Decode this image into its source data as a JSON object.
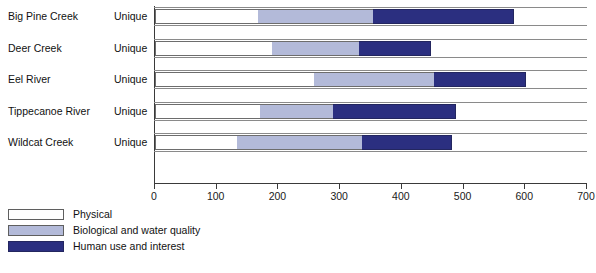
{
  "chart_data": {
    "type": "bar",
    "orientation": "horizontal",
    "stacked": true,
    "title": "",
    "xlabel": "",
    "ylabel": "",
    "xlim": [
      0,
      700
    ],
    "xticks": [
      0,
      100,
      200,
      300,
      400,
      500,
      600,
      700
    ],
    "grid": false,
    "legend_position": "bottom-left",
    "categories": [
      "Big Pine Creek",
      "Deer Creek",
      "Eel River",
      "Tippecanoe River",
      "Wildcat Creek"
    ],
    "row_annotations": [
      "Unique",
      "Unique",
      "Unique",
      "Unique",
      "Unique"
    ],
    "series": [
      {
        "name": "Physical",
        "color": "#ffffff",
        "values": [
          167,
          190,
          258,
          170,
          133
        ]
      },
      {
        "name": "Biological and water quality",
        "color": "#b3bad9",
        "values": [
          186,
          141,
          194,
          119,
          202
        ]
      },
      {
        "name": "Human use and interest",
        "color": "#2b2f80",
        "values": [
          229,
          116,
          149,
          199,
          146
        ]
      }
    ],
    "totals": [
      582,
      447,
      601,
      488,
      481
    ]
  },
  "legend": {
    "items": [
      {
        "label": "Physical",
        "swatch_class": "sw-physical"
      },
      {
        "label": "Biological and water quality",
        "swatch_class": "sw-bio"
      },
      {
        "label": "Human use and interest",
        "swatch_class": "sw-human"
      }
    ]
  }
}
